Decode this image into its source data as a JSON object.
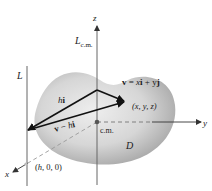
{
  "figure": {
    "labels": {
      "z_axis": "z",
      "y_axis": "y",
      "x_axis": "x",
      "L_cm_main": "L",
      "L_cm_sub": "c.m.",
      "L_line": "L",
      "v_eq": {
        "v": "v",
        "eq": " = ",
        "x": "x",
        "i": "i",
        "plus": " + ",
        "y": "y",
        "j": "j"
      },
      "point_xyz": "(x, y, z)",
      "hi": {
        "h": "h",
        "i": "i"
      },
      "v_minus_hi": {
        "v": "v",
        "minus": " − ",
        "h": "h",
        "i": "i"
      },
      "cm": "c.m.",
      "region": "D",
      "point_h00": {
        "open": "(",
        "h": "h",
        "rest": ", 0, 0)"
      }
    },
    "colors": {
      "region_fill_center": "#ececec",
      "region_fill_edge": "#a8a8a8",
      "axis": "#555555",
      "vector": "#111111",
      "text": "#1a1a1a"
    }
  }
}
